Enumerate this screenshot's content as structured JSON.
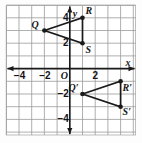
{
  "figure": {
    "kind": "coordinate-grid-reflection",
    "background": "#fdfdfd",
    "grid_color": "#9a9a9a",
    "axis_color": "#1a1a1a",
    "shape_color": "#1a1a1a"
  },
  "axes": {
    "x_label": "x",
    "y_label": "y",
    "origin_label": "O",
    "x_ticks": [
      {
        "value": -4,
        "text": "−4"
      },
      {
        "value": -2,
        "text": "−2"
      },
      {
        "value": 2,
        "text": "2"
      }
    ],
    "y_ticks": [
      {
        "value": 4,
        "text": "4"
      },
      {
        "value": 2,
        "text": "2"
      },
      {
        "value": -2,
        "text": "−2"
      },
      {
        "value": -4,
        "text": "−4"
      }
    ],
    "xlim": [
      -5,
      5
    ],
    "ylim": [
      -5,
      5
    ],
    "grid": true
  },
  "chart_data": {
    "type": "scatter",
    "title": "",
    "xlabel": "x",
    "ylabel": "y",
    "xlim": [
      -5,
      5
    ],
    "ylim": [
      -5,
      5
    ],
    "grid": true,
    "series": [
      {
        "name": "Triangle QRS",
        "closed": true,
        "points": [
          {
            "label": "Q",
            "x": -2,
            "y": 3,
            "label_dx": -13,
            "label_dy": -11
          },
          {
            "label": "R",
            "x": 1,
            "y": 4,
            "label_dx": 3,
            "label_dy": -12
          },
          {
            "label": "S",
            "x": 1,
            "y": 2,
            "label_dx": 3,
            "label_dy": 2
          }
        ]
      },
      {
        "name": "Triangle Q'R'S'",
        "closed": true,
        "points": [
          {
            "label": "Q′",
            "x": 1,
            "y": -2,
            "label_dx": -14,
            "label_dy": -11
          },
          {
            "label": "R′",
            "x": 4,
            "y": -1,
            "label_dx": 2,
            "label_dy": 2
          },
          {
            "label": "S′",
            "x": 4,
            "y": -3,
            "label_dx": 2,
            "label_dy": 0
          }
        ]
      }
    ]
  }
}
